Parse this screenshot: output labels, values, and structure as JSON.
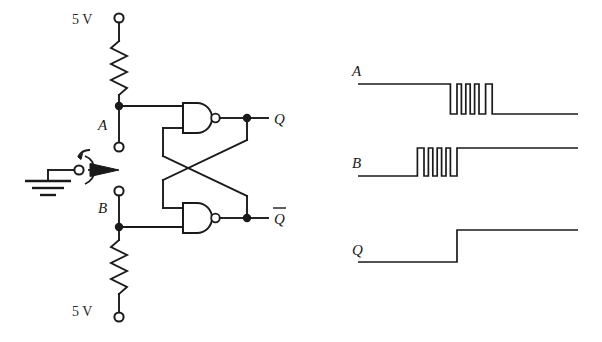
{
  "figure": {
    "ink_color": "#1a1a1a",
    "background": "#ffffff"
  },
  "circuit": {
    "supply_top_label": "5 V",
    "supply_bottom_label": "5 V",
    "input_a_label": "A",
    "input_b_label": "B",
    "output_q_label": "Q",
    "output_qbar_label": "Q",
    "output_qbar_overline": true,
    "gate_type": "NAND",
    "gate_count": 2,
    "resistor_count": 2,
    "ground_symbol": "earth-ground",
    "switch_type": "spdt-rotary-throw",
    "terminals": [
      {
        "name": "vcc-top-terminal",
        "label": "5 V"
      },
      {
        "name": "input-a-terminal",
        "label": "A"
      },
      {
        "name": "input-b-terminal",
        "label": "B"
      },
      {
        "name": "vcc-bottom-terminal",
        "label": "5 V"
      }
    ]
  },
  "chart_data": {
    "type": "line",
    "title": "",
    "xlabel": "",
    "ylabel": "",
    "grid": false,
    "legend_position": "left-axis-labels",
    "xlim": [
      0,
      100
    ],
    "ylim": [
      0,
      1
    ],
    "series": [
      {
        "name": "A",
        "label": "A",
        "initial_level": 1,
        "final_level": 0,
        "bounce": true,
        "bounce_start": 42,
        "bounce_end": 62,
        "bounce_pulses": 5,
        "points": [
          {
            "t": 0,
            "v": 1
          },
          {
            "t": 42,
            "v": 1
          },
          {
            "t": 42,
            "v": 0
          },
          {
            "t": 45,
            "v": 0
          },
          {
            "t": 45,
            "v": 1
          },
          {
            "t": 47,
            "v": 1
          },
          {
            "t": 47,
            "v": 0
          },
          {
            "t": 49,
            "v": 0
          },
          {
            "t": 49,
            "v": 1
          },
          {
            "t": 51,
            "v": 1
          },
          {
            "t": 51,
            "v": 0
          },
          {
            "t": 53,
            "v": 0
          },
          {
            "t": 53,
            "v": 1
          },
          {
            "t": 55,
            "v": 1
          },
          {
            "t": 55,
            "v": 0
          },
          {
            "t": 58,
            "v": 0
          },
          {
            "t": 58,
            "v": 1
          },
          {
            "t": 61,
            "v": 1
          },
          {
            "t": 61,
            "v": 0
          },
          {
            "t": 100,
            "v": 0
          }
        ]
      },
      {
        "name": "B",
        "label": "B",
        "initial_level": 0,
        "final_level": 1,
        "bounce": true,
        "bounce_start": 27,
        "bounce_end": 50,
        "bounce_pulses": 5,
        "points": [
          {
            "t": 0,
            "v": 0
          },
          {
            "t": 27,
            "v": 0
          },
          {
            "t": 27,
            "v": 1
          },
          {
            "t": 30,
            "v": 1
          },
          {
            "t": 30,
            "v": 0
          },
          {
            "t": 32,
            "v": 0
          },
          {
            "t": 32,
            "v": 1
          },
          {
            "t": 34,
            "v": 1
          },
          {
            "t": 34,
            "v": 0
          },
          {
            "t": 36,
            "v": 0
          },
          {
            "t": 36,
            "v": 1
          },
          {
            "t": 38,
            "v": 1
          },
          {
            "t": 38,
            "v": 0
          },
          {
            "t": 40,
            "v": 0
          },
          {
            "t": 40,
            "v": 1
          },
          {
            "t": 42,
            "v": 1
          },
          {
            "t": 42,
            "v": 0
          },
          {
            "t": 45,
            "v": 0
          },
          {
            "t": 45,
            "v": 1
          },
          {
            "t": 100,
            "v": 1
          }
        ]
      },
      {
        "name": "Q",
        "label": "Q",
        "initial_level": 0,
        "final_level": 1,
        "bounce": false,
        "transition_t": 45,
        "points": [
          {
            "t": 0,
            "v": 0
          },
          {
            "t": 45,
            "v": 0
          },
          {
            "t": 45,
            "v": 1
          },
          {
            "t": 100,
            "v": 1
          }
        ]
      }
    ]
  }
}
